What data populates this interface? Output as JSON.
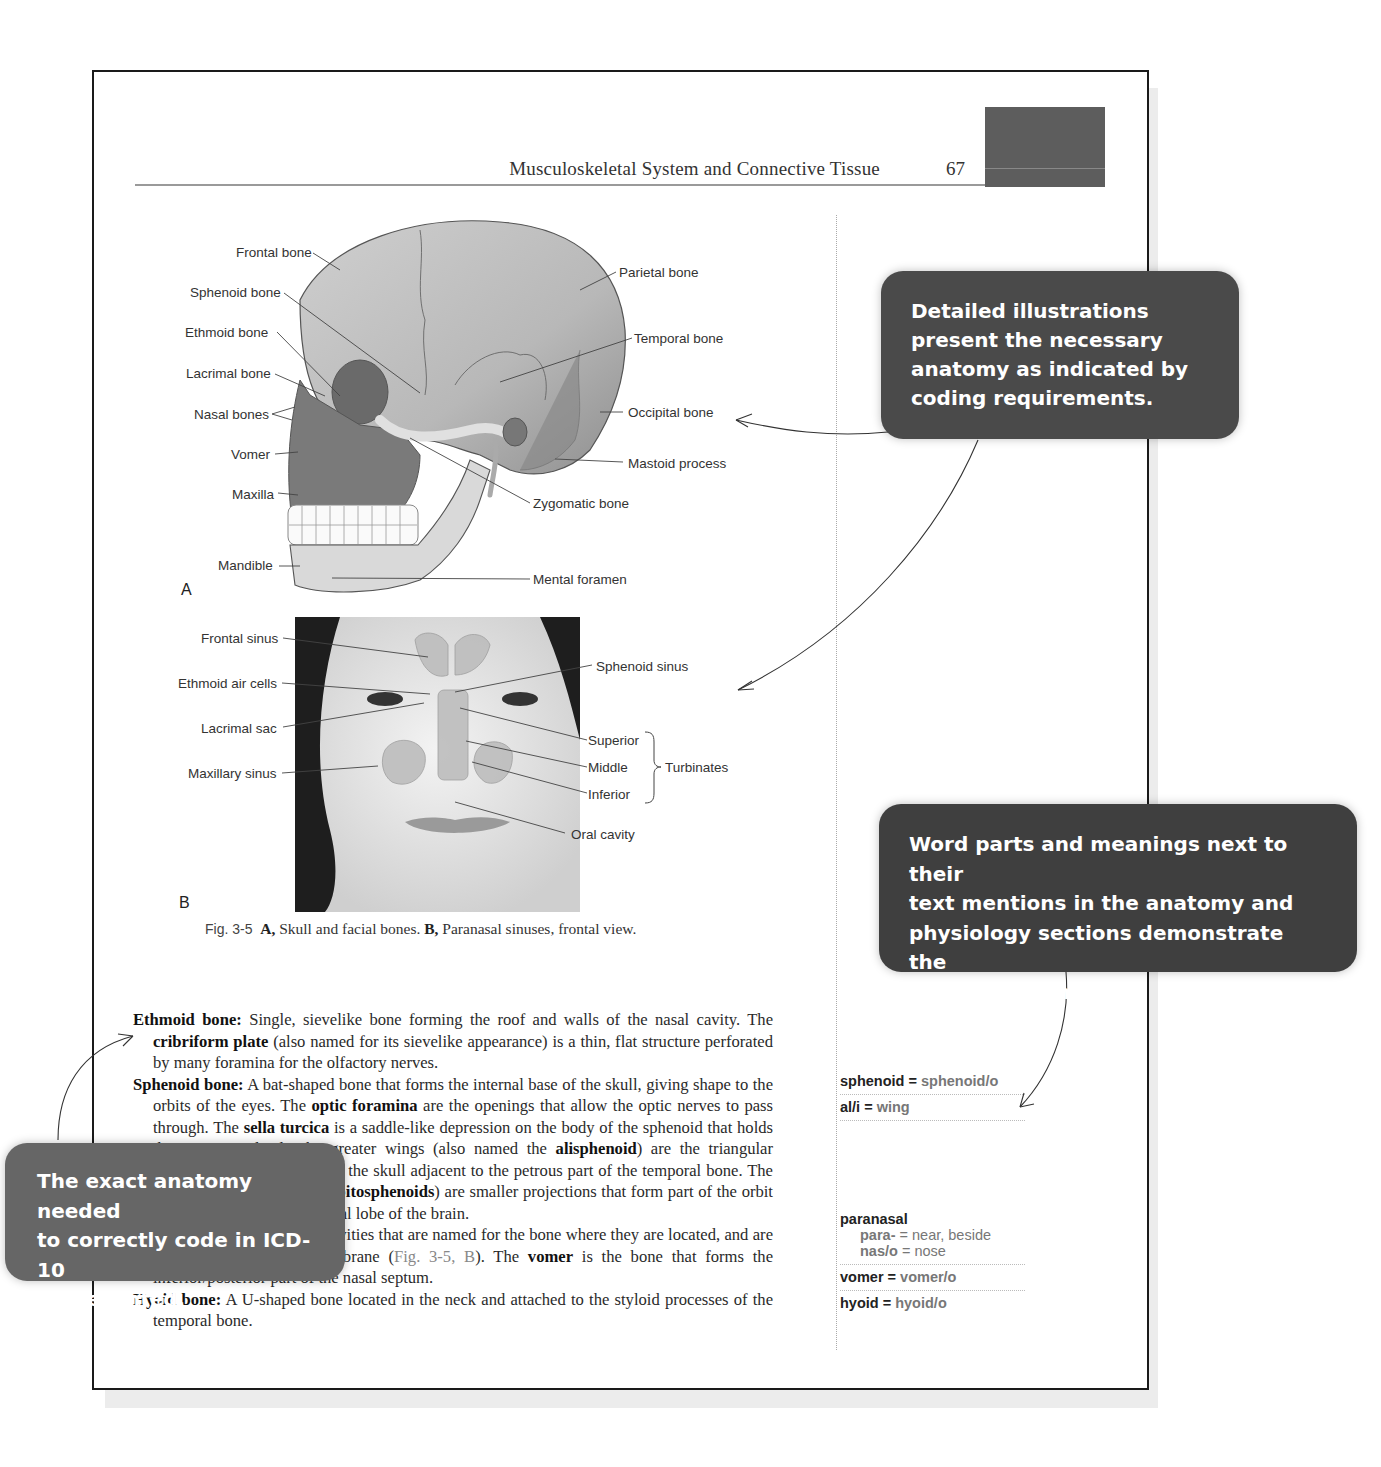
{
  "running_head": {
    "title": "Musculoskeletal System and Connective Tissue",
    "page_number": "67"
  },
  "figure": {
    "panel_a": {
      "letter": "A",
      "labels_left": [
        "Frontal bone",
        "Sphenoid bone",
        "Ethmoid bone",
        "Lacrimal bone",
        "Nasal bones",
        "Vomer",
        "Maxilla",
        "Mandible"
      ],
      "labels_right": [
        "Parietal bone",
        "Temporal bone",
        "Occipital bone",
        "Mastoid process",
        "Zygomatic bone",
        "Mental foramen"
      ]
    },
    "panel_b": {
      "letter": "B",
      "labels_left": [
        "Frontal sinus",
        "Ethmoid air cells",
        "Lacrimal sac",
        "Maxillary sinus"
      ],
      "labels_right": [
        "Sphenoid sinus",
        "Superior",
        "Middle",
        "Inferior",
        "Oral cavity"
      ],
      "bracket_label": "Turbinates"
    },
    "caption": {
      "number": "Fig. 3-5",
      "a_label": "A,",
      "a_text": "Skull and facial bones.",
      "b_label": "B,",
      "b_text": "Paranasal sinuses, frontal view."
    }
  },
  "body": {
    "ethmoid": {
      "term": "Ethmoid bone:",
      "t1": "Single, sievelike bone forming the roof and walls of the nasal cavity. The",
      "b1": "cribriform plate",
      "t2": "(also named for its sievelike appearance) is a thin, flat structure perforated by many foramina for the olfactory nerves."
    },
    "sphenoid": {
      "term": "Sphenoid bone:",
      "t1": "A bat-shaped bone that forms the internal base of the skull, giving shape to the orbits of the eyes. The",
      "b1": "optic foramina",
      "t2": "are the openings that allow the optic nerves to pass through. The",
      "b2": "sella turcica",
      "t3": "is a saddle-like depression on the body of the sphenoid that holds the pituitary gland. The greater wings (also named the",
      "b3": "alisphenoid",
      "t4": ") are the triangular projections that form part of the skull adjacent to the petrous part of the temporal bone. The lesser wings (also called",
      "b4": "orbitosphenoids",
      "t5": ") are smaller projections that form part of the orbit and support part of the frontal lobe of the brain."
    },
    "sinuses": {
      "t1": "Paranasal sinuses: Air-filled cavities that are named for the bone where they are located, and are lined with a mucous membrane (",
      "ref": "Fig. 3-5, B",
      "t2": "). The",
      "b1": "vomer",
      "t3": "is the bone that forms the inferior/posterior part of the nasal septum."
    },
    "hyoid": {
      "term": "Hyoid bone:",
      "t1": "A U-shaped bone located in the neck and attached to the styloid processes of the temporal bone."
    }
  },
  "sidebar": {
    "group1": [
      {
        "word": "sphenoid",
        "eq": "=",
        "part": "sphenoid/o"
      },
      {
        "word": "al/i",
        "eq": "=",
        "part": "wing"
      }
    ],
    "group2": {
      "heading": "paranasal",
      "parts": [
        {
          "part": "para-",
          "eq": "=",
          "meaning": "near, beside"
        },
        {
          "part": "nas/o",
          "eq": "=",
          "meaning": "nose"
        }
      ],
      "items": [
        {
          "word": "vomer",
          "eq": "=",
          "part": "vomer/o"
        },
        {
          "word": "hyoid",
          "eq": "=",
          "part": "hyoid/o"
        }
      ]
    }
  },
  "callouts": {
    "illustrations": [
      "Detailed illustrations",
      "present the necessary",
      "anatomy as indicated by",
      "coding requirements."
    ],
    "word_parts": [
      "Word parts and meanings next to their",
      "text mentions in the anatomy and",
      "physiology sections demonstrate the",
      "origins of terms."
    ],
    "icd10": [
      "The exact anatomy needed",
      "to correctly code in ICD-10",
      "is presented."
    ]
  },
  "colors": {
    "callout_dark": "#4a4a4a",
    "callout_mid": "#666666",
    "thumb_tab": "#5d5d5d",
    "word_part_gray": "#777777"
  }
}
